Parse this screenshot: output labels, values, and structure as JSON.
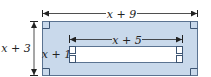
{
  "diagram": {
    "type": "rectangle-frame-area",
    "outer": {
      "width_label": "x + 9",
      "height_label": "x + 3",
      "fill_color": "#c9d9eb",
      "border_color": "#5b7391",
      "right_angle_markers": [
        "top-left",
        "top-right",
        "bottom-left",
        "bottom-right"
      ]
    },
    "inner": {
      "width_label": "x + 5",
      "height_label": "x + 1",
      "fill_color": "#ffffff",
      "border_color": "#5b7391",
      "right_angle_markers": [
        "left-top",
        "left-bottom",
        "right-top",
        "right-bottom"
      ]
    },
    "dimension_line_color": "#222222"
  }
}
